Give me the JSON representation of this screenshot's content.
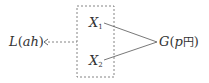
{
  "diagram": {
    "left_node": {
      "main": "L",
      "open": "(",
      "arg": "ah",
      "close": ")"
    },
    "inner_nodes": [
      {
        "main": "X",
        "sub": "1"
      },
      {
        "main": "X",
        "sub": "2"
      }
    ],
    "right_node": {
      "main": "G",
      "open": "(",
      "arg": "p",
      "unit": "円",
      "close": ")"
    },
    "colors": {
      "line": "#555555",
      "text": "#333333"
    }
  }
}
